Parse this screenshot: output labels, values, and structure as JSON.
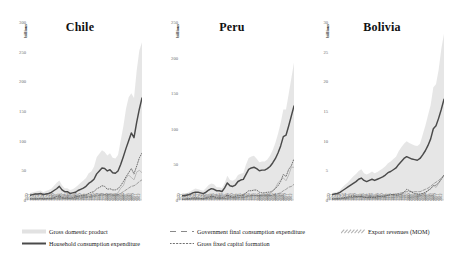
{
  "figure": {
    "axis_name": "billions",
    "x_start_year": 1970,
    "x_end_year": 2012
  },
  "legend": {
    "items": [
      {
        "label": "Gross domestic product",
        "style": "band",
        "color": "#e2e2e2"
      },
      {
        "label": "Household consumption expenditure",
        "style": "solid",
        "color": "#4a4a4a"
      },
      {
        "label": "Government final consumption expenditure",
        "style": "dashed",
        "color": "#8a8a8a"
      },
      {
        "label": "Gross fixed capital formation",
        "style": "dotted",
        "color": "#6f6f6f"
      },
      {
        "label": "Export revenues (MOM)",
        "style": "hatch",
        "color": "#b5b5b5"
      }
    ]
  },
  "chart_data": [
    {
      "type": "line",
      "title": "Chile",
      "xlabel": "",
      "ylabel": "billions",
      "ylim": [
        0,
        300
      ],
      "yticks": [
        0,
        50,
        100,
        150,
        200,
        250,
        300
      ],
      "xlim": [
        1970,
        2012
      ],
      "grid": false,
      "legend_position": "bottom",
      "x": [
        1970,
        1971,
        1972,
        1973,
        1974,
        1975,
        1976,
        1977,
        1978,
        1979,
        1980,
        1981,
        1982,
        1983,
        1984,
        1985,
        1986,
        1987,
        1988,
        1989,
        1990,
        1991,
        1992,
        1993,
        1994,
        1995,
        1996,
        1997,
        1998,
        1999,
        2000,
        2001,
        2002,
        2003,
        2004,
        2005,
        2006,
        2007,
        2008,
        2009,
        2010,
        2011,
        2012
      ],
      "series": [
        {
          "name": "Gross domestic product",
          "values": [
            12,
            13,
            14,
            15,
            16,
            13,
            15,
            17,
            19,
            24,
            29,
            33,
            25,
            20,
            20,
            17,
            18,
            21,
            25,
            29,
            33,
            37,
            45,
            48,
            56,
            72,
            78,
            84,
            81,
            75,
            79,
            71,
            70,
            76,
            100,
            124,
            154,
            173,
            180,
            172,
            218,
            252,
            266
          ]
        },
        {
          "name": "Household consumption expenditure",
          "values": [
            8,
            9,
            10,
            10,
            11,
            9,
            10,
            11,
            13,
            16,
            19,
            23,
            17,
            14,
            14,
            11,
            12,
            13,
            16,
            18,
            20,
            23,
            28,
            31,
            35,
            44,
            49,
            54,
            53,
            49,
            51,
            46,
            45,
            49,
            60,
            73,
            87,
            100,
            113,
            105,
            131,
            153,
            172
          ]
        },
        {
          "name": "Government final consumption expenditure",
          "values": [
            2,
            2,
            2,
            2,
            2,
            2,
            2,
            2,
            2,
            3,
            3,
            4,
            3,
            3,
            3,
            2,
            2,
            2,
            3,
            3,
            4,
            4,
            5,
            5,
            6,
            7,
            8,
            9,
            9,
            9,
            9,
            8,
            8,
            9,
            11,
            14,
            17,
            20,
            23,
            24,
            27,
            31,
            34
          ]
        },
        {
          "name": "Gross fixed capital formation",
          "values": [
            2,
            2,
            2,
            2,
            3,
            2,
            2,
            3,
            3,
            4,
            6,
            7,
            4,
            3,
            4,
            3,
            4,
            5,
            6,
            7,
            8,
            8,
            11,
            13,
            14,
            19,
            21,
            24,
            23,
            18,
            19,
            17,
            17,
            19,
            24,
            31,
            39,
            46,
            53,
            44,
            57,
            71,
            79
          ]
        },
        {
          "name": "Export revenues (MOM)",
          "values": [
            1,
            1,
            1,
            1,
            2,
            1,
            2,
            2,
            2,
            3,
            3,
            3,
            3,
            3,
            3,
            3,
            3,
            4,
            5,
            5,
            6,
            6,
            6,
            6,
            8,
            11,
            10,
            11,
            9,
            10,
            11,
            10,
            10,
            12,
            20,
            24,
            37,
            42,
            38,
            34,
            47,
            50,
            46
          ]
        }
      ]
    },
    {
      "type": "line",
      "title": "Peru",
      "xlabel": "",
      "ylabel": "billions",
      "ylim": [
        0,
        250
      ],
      "yticks": [
        0,
        50,
        100,
        150,
        200,
        250
      ],
      "xlim": [
        1970,
        2012
      ],
      "grid": false,
      "legend_position": "bottom",
      "x": [
        1970,
        1971,
        1972,
        1973,
        1974,
        1975,
        1976,
        1977,
        1978,
        1979,
        1980,
        1981,
        1982,
        1983,
        1984,
        1985,
        1986,
        1987,
        1988,
        1989,
        1990,
        1991,
        1992,
        1993,
        1994,
        1995,
        1996,
        1997,
        1998,
        1999,
        2000,
        2001,
        2002,
        2003,
        2004,
        2005,
        2006,
        2007,
        2008,
        2009,
        2010,
        2011,
        2012
      ],
      "series": [
        {
          "name": "Gross domestic product",
          "values": [
            8,
            9,
            10,
            12,
            14,
            16,
            15,
            14,
            13,
            17,
            21,
            23,
            22,
            18,
            18,
            17,
            24,
            34,
            28,
            27,
            29,
            35,
            37,
            38,
            50,
            59,
            61,
            62,
            58,
            53,
            54,
            54,
            57,
            62,
            70,
            80,
            93,
            108,
            127,
            127,
            149,
            171,
            193
          ]
        },
        {
          "name": "Household consumption expenditure",
          "values": [
            6,
            6,
            7,
            8,
            10,
            11,
            11,
            10,
            9,
            11,
            14,
            16,
            15,
            13,
            13,
            12,
            17,
            24,
            20,
            19,
            21,
            26,
            28,
            29,
            36,
            43,
            45,
            46,
            44,
            41,
            42,
            42,
            44,
            47,
            52,
            58,
            66,
            76,
            89,
            91,
            104,
            118,
            132
          ]
        },
        {
          "name": "Government final consumption expenditure",
          "values": [
            1,
            1,
            1,
            1,
            2,
            2,
            2,
            2,
            1,
            2,
            2,
            3,
            3,
            2,
            2,
            2,
            2,
            3,
            3,
            3,
            3,
            3,
            4,
            4,
            5,
            6,
            6,
            6,
            6,
            6,
            6,
            6,
            6,
            6,
            7,
            8,
            9,
            10,
            13,
            15,
            18,
            19,
            22
          ]
        },
        {
          "name": "Gross fixed capital formation",
          "values": [
            1,
            1,
            2,
            2,
            3,
            3,
            3,
            2,
            2,
            3,
            4,
            5,
            5,
            3,
            3,
            3,
            4,
            7,
            5,
            4,
            5,
            6,
            6,
            7,
            10,
            13,
            13,
            14,
            14,
            11,
            10,
            10,
            11,
            11,
            13,
            16,
            20,
            26,
            36,
            33,
            43,
            48,
            58
          ]
        },
        {
          "name": "Export revenues (MOM)",
          "values": [
            1,
            1,
            1,
            1,
            1,
            1,
            1,
            1,
            2,
            3,
            3,
            3,
            3,
            3,
            3,
            3,
            2,
            2,
            3,
            3,
            3,
            3,
            3,
            3,
            4,
            5,
            6,
            7,
            6,
            6,
            7,
            7,
            8,
            9,
            12,
            17,
            24,
            28,
            31,
            27,
            35,
            46,
            46
          ]
        }
      ]
    },
    {
      "type": "line",
      "title": "Bolivia",
      "xlabel": "",
      "ylabel": "billions",
      "ylim": [
        0,
        30
      ],
      "yticks": [
        0,
        5,
        10,
        15,
        20,
        25,
        30
      ],
      "xlim": [
        1970,
        2012
      ],
      "grid": false,
      "legend_position": "bottom",
      "x": [
        1970,
        1971,
        1972,
        1973,
        1974,
        1975,
        1976,
        1977,
        1978,
        1979,
        1980,
        1981,
        1982,
        1983,
        1984,
        1985,
        1986,
        1987,
        1988,
        1989,
        1990,
        1991,
        1992,
        1993,
        1994,
        1995,
        1996,
        1997,
        1998,
        1999,
        2000,
        2001,
        2002,
        2003,
        2004,
        2005,
        2006,
        2007,
        2008,
        2009,
        2010,
        2011,
        2012
      ],
      "series": [
        {
          "name": "Gross domestic product",
          "values": [
            1.2,
            1.3,
            1.4,
            1.7,
            2.2,
            2.6,
            3.0,
            3.5,
            4.0,
            4.4,
            4.9,
            5.2,
            4.5,
            4.3,
            4.5,
            4.8,
            4.5,
            4.7,
            5.0,
            5.3,
            5.7,
            6.2,
            6.5,
            6.9,
            7.3,
            8.2,
            8.9,
            9.5,
            9.9,
            9.6,
            9.4,
            9.2,
            9.1,
            9.5,
            11.0,
            12.5,
            14.3,
            16.0,
            19.0,
            19.5,
            22.0,
            25.5,
            28.0
          ]
        },
        {
          "name": "Household consumption expenditure",
          "values": [
            0.9,
            1.0,
            1.1,
            1.3,
            1.6,
            1.9,
            2.2,
            2.5,
            2.8,
            3.1,
            3.5,
            3.7,
            3.3,
            3.1,
            3.3,
            3.5,
            3.3,
            3.5,
            3.7,
            3.9,
            4.2,
            4.6,
            4.8,
            5.1,
            5.4,
            6.0,
            6.5,
            7.0,
            7.3,
            7.1,
            6.9,
            6.8,
            6.7,
            7.0,
            7.6,
            8.3,
            9.2,
            10.3,
            12.0,
            12.5,
            13.8,
            15.3,
            17.0
          ]
        },
        {
          "name": "Government final consumption expenditure",
          "values": [
            0.15,
            0.16,
            0.18,
            0.2,
            0.25,
            0.3,
            0.35,
            0.4,
            0.45,
            0.5,
            0.55,
            0.6,
            0.5,
            0.45,
            0.5,
            0.55,
            0.5,
            0.55,
            0.6,
            0.65,
            0.7,
            0.8,
            0.85,
            0.9,
            0.95,
            1.1,
            1.2,
            1.3,
            1.4,
            1.4,
            1.4,
            1.4,
            1.4,
            1.4,
            1.6,
            1.8,
            2.0,
            2.3,
            2.7,
            3.0,
            3.3,
            3.7,
            4.2
          ]
        },
        {
          "name": "Gross fixed capital formation",
          "values": [
            0.2,
            0.22,
            0.25,
            0.3,
            0.35,
            0.45,
            0.5,
            0.6,
            0.65,
            0.6,
            0.6,
            0.6,
            0.45,
            0.4,
            0.4,
            0.45,
            0.4,
            0.5,
            0.55,
            0.6,
            0.65,
            0.8,
            0.9,
            0.95,
            0.8,
            0.85,
            1.0,
            1.3,
            1.8,
            1.6,
            1.3,
            1.1,
            1.0,
            1.0,
            1.1,
            1.3,
            1.6,
            1.9,
            2.4,
            2.5,
            2.9,
            3.5,
            4.2
          ]
        },
        {
          "name": "Export revenues (MOM)",
          "values": [
            0.1,
            0.1,
            0.12,
            0.15,
            0.25,
            0.25,
            0.3,
            0.35,
            0.35,
            0.4,
            0.45,
            0.4,
            0.35,
            0.35,
            0.35,
            0.3,
            0.25,
            0.25,
            0.3,
            0.4,
            0.4,
            0.4,
            0.4,
            0.4,
            0.5,
            0.55,
            0.5,
            0.5,
            0.45,
            0.4,
            0.45,
            0.5,
            0.55,
            0.7,
            0.9,
            1.1,
            1.6,
            1.9,
            2.5,
            2.1,
            2.8,
            3.6,
            4.0
          ]
        }
      ]
    }
  ]
}
